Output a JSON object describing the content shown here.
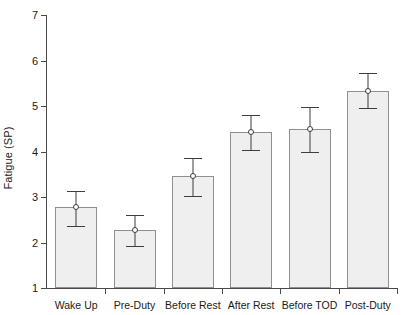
{
  "chart_data": {
    "type": "bar",
    "title": "",
    "xlabel": "",
    "ylabel": "Fatigue (SP)",
    "categories": [
      "Wake Up",
      "Pre-Duty",
      "Before Rest",
      "After Rest",
      "Before TOD",
      "Post-Duty"
    ],
    "values": [
      2.78,
      2.27,
      3.46,
      4.43,
      4.5,
      5.33
    ],
    "errors_upper": [
      3.13,
      2.6,
      3.86,
      4.8,
      4.98,
      5.73
    ],
    "errors_lower": [
      2.37,
      1.92,
      3.02,
      4.03,
      3.99,
      4.95
    ],
    "error_plus": [
      0.35,
      0.33,
      0.4,
      0.37,
      0.48,
      0.4
    ],
    "error_minus": [
      0.41,
      0.35,
      0.44,
      0.4,
      0.51,
      0.38
    ],
    "ylim": [
      1,
      7
    ],
    "yticks": [
      1,
      2,
      3,
      4,
      5,
      6,
      7
    ],
    "ytick_labels": [
      "1",
      "2",
      "3",
      "4",
      "5",
      "6",
      "7"
    ],
    "grid": false,
    "legend": "none",
    "marker_style": "open-circle",
    "bar_fill_color": "#efefef",
    "bar_edge_color": "#8f8f8f",
    "error_bar_color": "#3d3d3d",
    "axis_color": "#4a4a4a"
  }
}
